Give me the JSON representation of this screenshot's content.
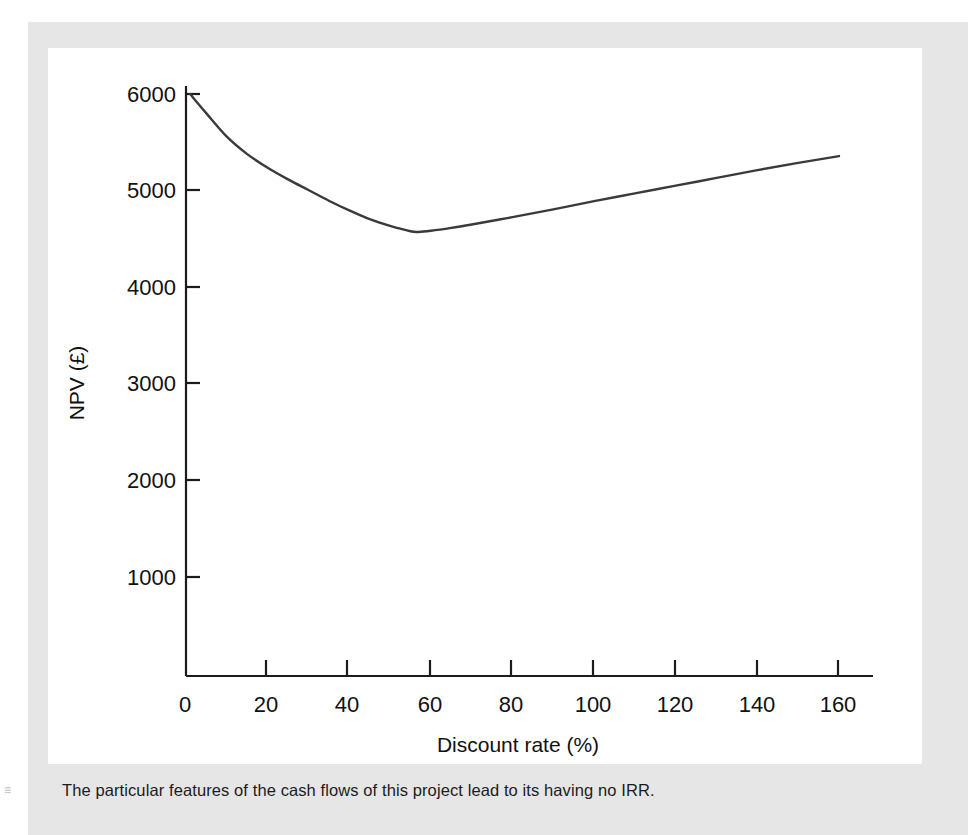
{
  "figure": {
    "caption": "The particular features of the cash flows of this project lead to its having no IRR.",
    "marker": "≡"
  },
  "chart_data": {
    "type": "line",
    "title": "",
    "xlabel": "Discount rate (%)",
    "ylabel": "NPV (£)",
    "xlim": [
      0,
      170
    ],
    "ylim": [
      0,
      6400
    ],
    "xticks": [
      0,
      20,
      40,
      60,
      80,
      100,
      120,
      140,
      160
    ],
    "xtick_labels": [
      "0",
      "20",
      "40",
      "60",
      "80",
      "100",
      "120",
      "140",
      "160"
    ],
    "yticks": [
      1000,
      2000,
      3000,
      4000,
      5000,
      6000
    ],
    "ytick_labels": [
      "1000",
      "2000",
      "3000",
      "4000",
      "5000",
      "6000"
    ],
    "grid": false,
    "legend": false,
    "line_color": "#3a3a3a",
    "axis_color": "#1c1c1c",
    "series": [
      {
        "name": "NPV",
        "x": [
          1,
          5,
          10,
          15,
          20,
          25,
          30,
          35,
          40,
          45,
          50,
          55,
          57,
          60,
          65,
          70,
          80,
          90,
          100,
          110,
          120,
          130,
          140,
          150,
          160
        ],
        "y": [
          6000,
          5800,
          5560,
          5380,
          5240,
          5120,
          5010,
          4900,
          4800,
          4710,
          4640,
          4585,
          4578,
          4590,
          4620,
          4655,
          4730,
          4810,
          4895,
          4975,
          5055,
          5135,
          5215,
          5290,
          5360
        ]
      }
    ],
    "annotations": {
      "minimum": {
        "x": 57,
        "y": 4578
      },
      "start": {
        "x": 1,
        "y": 6000
      },
      "end": {
        "x": 160,
        "y": 5360
      }
    }
  }
}
